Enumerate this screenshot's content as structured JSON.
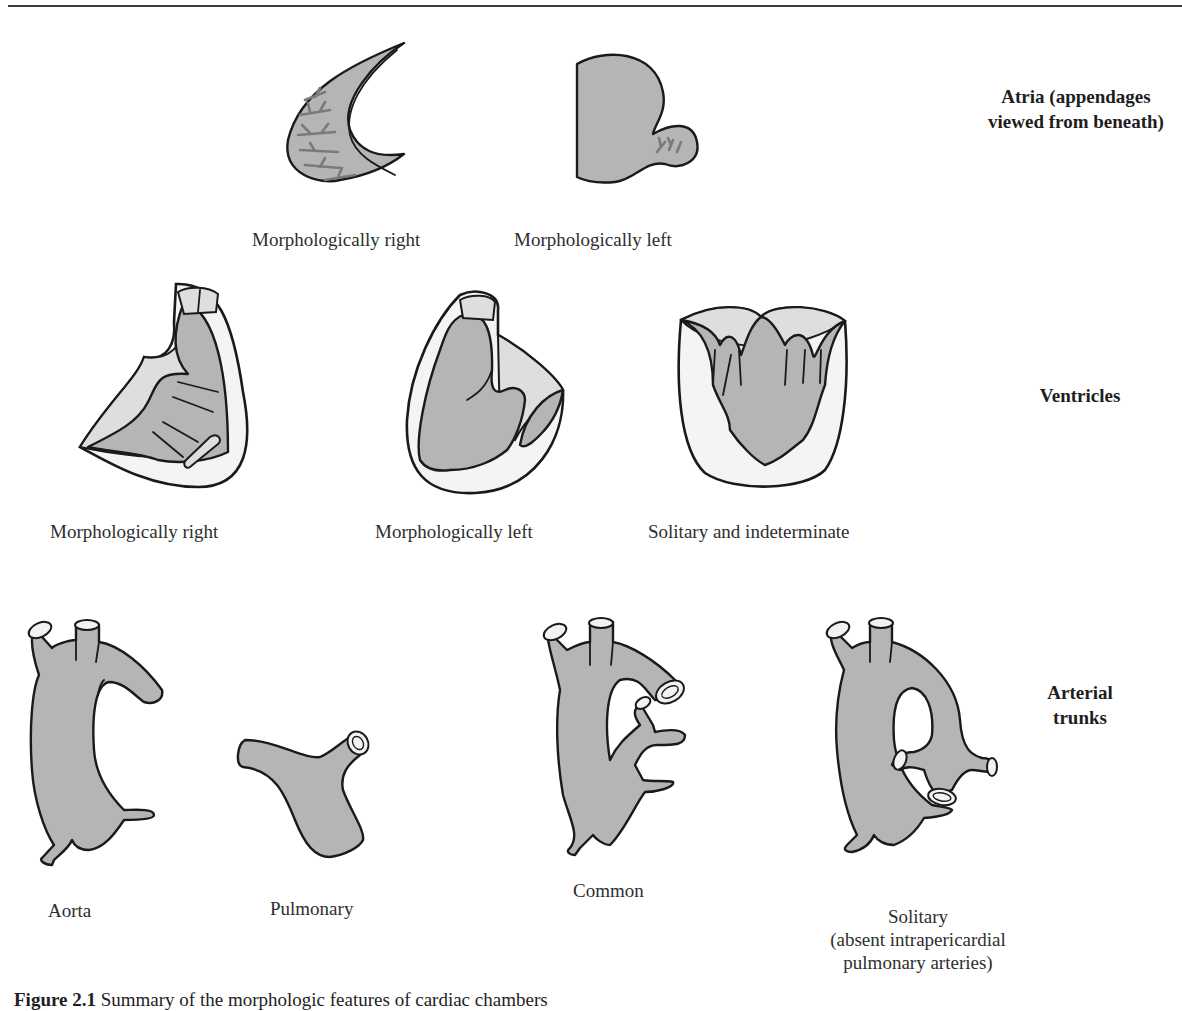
{
  "figure": {
    "rows": [
      {
        "id": "atria",
        "label": "Atria (appendages viewed from beneath)",
        "label_lines": [
          "Atria (appendages",
          "viewed from beneath)"
        ],
        "items": [
          {
            "name": "morphologically-right-atrium",
            "caption": "Morphologically right"
          },
          {
            "name": "morphologically-left-atrium",
            "caption": "Morphologically left"
          }
        ]
      },
      {
        "id": "ventricles",
        "label": "Ventricles",
        "items": [
          {
            "name": "morphologically-right-ventricle",
            "caption": "Morphologically right"
          },
          {
            "name": "morphologically-left-ventricle",
            "caption": "Morphologically left"
          },
          {
            "name": "solitary-indeterminate-ventricle",
            "caption": "Solitary and indeterminate"
          }
        ]
      },
      {
        "id": "arterial-trunks",
        "label": "Arterial trunks",
        "label_lines": [
          "Arterial",
          "trunks"
        ],
        "items": [
          {
            "name": "aorta-trunk",
            "caption": "Aorta"
          },
          {
            "name": "pulmonary-trunk",
            "caption": "Pulmonary"
          },
          {
            "name": "common-trunk",
            "caption": "Common"
          },
          {
            "name": "solitary-trunk",
            "caption_lines": [
              "Solitary",
              "(absent intrapericardial",
              "pulmonary arteries)"
            ]
          }
        ]
      }
    ],
    "caption": {
      "prefix": "Figure 2.1",
      "text": "Summary of the morphologic features of cardiac chambers"
    },
    "colors": {
      "fill": "#b5b5b5",
      "light_fill": "#dedede",
      "outline": "#1a1a1a",
      "trabeculation": "#7a7a7a",
      "background": "#ffffff"
    }
  }
}
